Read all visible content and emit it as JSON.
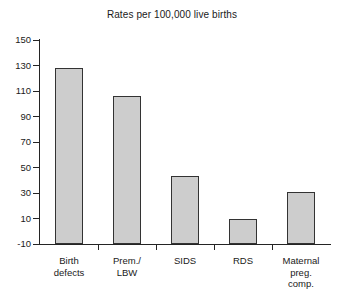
{
  "chart_data": {
    "type": "bar",
    "title": "Rates per 100,000 live births",
    "xlabel": "",
    "ylabel": "",
    "categories": [
      "Birth defects",
      "Prem./ LBW",
      "SIDS",
      "RDS",
      "Maternal preg. comp."
    ],
    "category_lines": [
      [
        "Birth",
        "defects"
      ],
      [
        "Prem./",
        "LBW"
      ],
      [
        "SIDS"
      ],
      [
        "RDS"
      ],
      [
        "Maternal",
        "preg.",
        "comp."
      ]
    ],
    "values": [
      128,
      106,
      43,
      10,
      31
    ],
    "ylim": [
      -10,
      150
    ],
    "yticks": [
      -10,
      10,
      30,
      50,
      70,
      90,
      110,
      130,
      150
    ],
    "ytick_labels": [
      "-10",
      "10",
      "30",
      "50",
      "70",
      "90",
      "110",
      "130",
      "150"
    ],
    "grid": false,
    "legend": null,
    "bar_fill_color": "#cdcdcd",
    "bar_edge_color": "#333333",
    "axis_color": "#242424",
    "background_color": "#ffffff"
  }
}
